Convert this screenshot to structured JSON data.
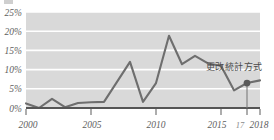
{
  "chart_data": {
    "type": "line",
    "title": "",
    "subtitle": "",
    "xlabel": "",
    "ylabel": "",
    "x": [
      2000,
      2001,
      2002,
      2003,
      2004,
      2005,
      2006,
      2007,
      2008,
      2009,
      2010,
      2011,
      2012,
      2013,
      2014,
      2015,
      2016,
      2017,
      2018
    ],
    "values": [
      1.2,
      0.0,
      2.4,
      0.2,
      1.3,
      1.5,
      1.6,
      6.8,
      12.0,
      1.6,
      6.5,
      18.8,
      11.4,
      13.6,
      11.6,
      11.0,
      4.6,
      6.5,
      7.2
    ],
    "series": [
      {
        "name": "rate",
        "values": [
          1.2,
          0.0,
          2.4,
          0.2,
          1.3,
          1.5,
          1.6,
          6.8,
          12.0,
          1.6,
          6.5,
          18.8,
          11.4,
          13.6,
          11.6,
          11.0,
          4.6,
          6.5,
          7.2
        ]
      }
    ],
    "ylim": [
      0,
      25
    ],
    "xlim": [
      2000,
      2018
    ],
    "ytick_values": [
      0,
      5,
      10,
      15,
      20,
      25
    ],
    "ytick_labels": [
      "0%",
      "5%",
      "10%",
      "15%",
      "20%",
      "25%"
    ],
    "xtick_values": [
      2000,
      2005,
      2010,
      2015,
      2017,
      2018
    ],
    "xtick_labels": [
      "2000",
      "2005",
      "2010",
      "2015",
      "17",
      "2018"
    ],
    "grid": true,
    "legend": false,
    "legend_position": "none",
    "annotations": [
      {
        "text": "更改統計方式",
        "x": 2017,
        "y": 6.5,
        "marker": true
      }
    ],
    "colors": {
      "line": "#6e6e6e",
      "plot_background": "#d9d9d9",
      "gridline": "#ffffff",
      "axis": "#555555",
      "marker": "#5a5a5a",
      "tick_text": "#5e5e5e",
      "annotation_text": "#4a4a4a",
      "page_background": "#ffffff"
    }
  }
}
